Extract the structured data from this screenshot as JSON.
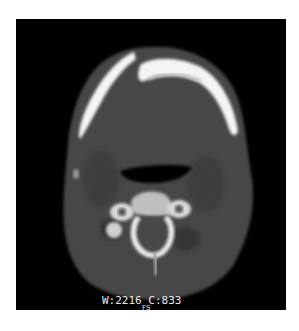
{
  "image": {
    "description": "Axial CT slice of the neck at mandible level showing mandibular arch, airway and cervical vertebra",
    "modality_view": "axial CT, bone window"
  },
  "overlay": {
    "window_level": "W:2216 C:833",
    "series_marker": "FS"
  },
  "colors": {
    "background": "#ffffff",
    "panel": "#000000",
    "soft_tissue": "#4a4a4a",
    "bone": "#f2f2f2",
    "overlay_text": "#e8e8e8"
  }
}
